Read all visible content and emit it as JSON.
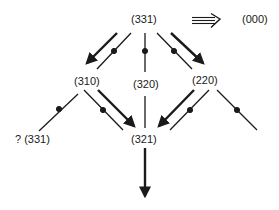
{
  "diagram": {
    "nodes": {
      "top": "(331)",
      "target": "(000)",
      "left": "(310)",
      "middle": "(320)",
      "right": "(220)",
      "bottom": "(321)",
      "far_left": "? (331)"
    },
    "implication_symbol": "⟹",
    "colors": {
      "ink": "#1a1a1a",
      "background": "#ffffff"
    }
  }
}
